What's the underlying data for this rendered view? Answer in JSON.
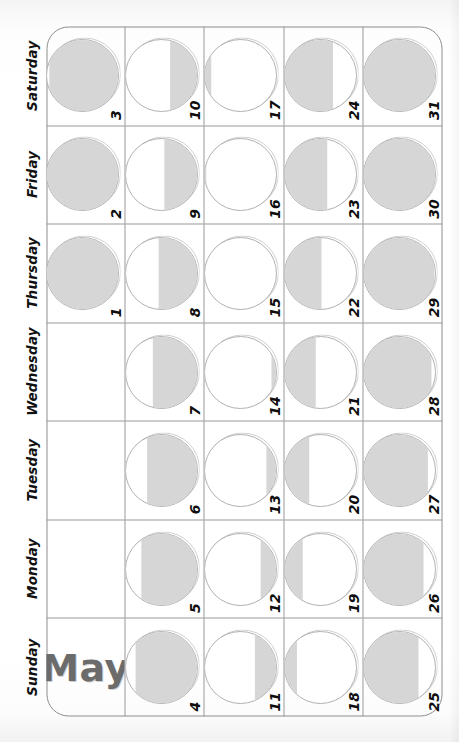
{
  "calendar": {
    "month_label": "May",
    "day_names": [
      "Sunday",
      "Monday",
      "Tuesday",
      "Wednesday",
      "Thursday",
      "Friday",
      "Saturday"
    ],
    "moon_fill_color": "#d6d6d6",
    "moon_outline_color": "#a8a8a8",
    "grid_line_color": "#9a9a9a",
    "text_color": "#111111",
    "month_text_color": "#6b6b6b",
    "weeks": [
      [
        {
          "kind": "month-title",
          "label": "May"
        },
        {
          "kind": "blank"
        },
        {
          "kind": "blank"
        },
        {
          "kind": "blank"
        },
        {
          "kind": "day",
          "number": "1",
          "illumination": 100,
          "phase": "full-moon",
          "shade": "top"
        },
        {
          "kind": "day",
          "number": "2",
          "illumination": 100,
          "phase": "full-moon",
          "shade": "top"
        },
        {
          "kind": "day",
          "number": "3",
          "illumination": 96,
          "phase": "waning-gibbous",
          "shade": "top"
        }
      ],
      [
        {
          "kind": "day",
          "number": "4",
          "illumination": 86,
          "phase": "waning-gibbous",
          "shade": "top"
        },
        {
          "kind": "day",
          "number": "5",
          "illumination": 78,
          "phase": "waning-gibbous",
          "shade": "top"
        },
        {
          "kind": "day",
          "number": "6",
          "illumination": 70,
          "phase": "waning-gibbous",
          "shade": "top"
        },
        {
          "kind": "day",
          "number": "7",
          "illumination": 62,
          "phase": "waning-gibbous",
          "shade": "top"
        },
        {
          "kind": "day",
          "number": "8",
          "illumination": 54,
          "phase": "last-quarter",
          "shade": "top"
        },
        {
          "kind": "day",
          "number": "9",
          "illumination": 46,
          "phase": "last-quarter",
          "shade": "top"
        },
        {
          "kind": "day",
          "number": "10",
          "illumination": 38,
          "phase": "waning-crescent",
          "shade": "top"
        }
      ],
      [
        {
          "kind": "day",
          "number": "11",
          "illumination": 30,
          "phase": "waning-crescent",
          "shade": "top"
        },
        {
          "kind": "day",
          "number": "12",
          "illumination": 22,
          "phase": "waning-crescent",
          "shade": "top"
        },
        {
          "kind": "day",
          "number": "13",
          "illumination": 14,
          "phase": "waning-crescent",
          "shade": "top"
        },
        {
          "kind": "day",
          "number": "14",
          "illumination": 7,
          "phase": "waning-crescent",
          "shade": "top"
        },
        {
          "kind": "day",
          "number": "15",
          "illumination": 1,
          "phase": "new-moon",
          "shade": "top"
        },
        {
          "kind": "day",
          "number": "16",
          "illumination": 1,
          "phase": "new-moon",
          "shade": "bottom"
        },
        {
          "kind": "day",
          "number": "17",
          "illumination": 8,
          "phase": "waxing-crescent",
          "shade": "bottom"
        }
      ],
      [
        {
          "kind": "day",
          "number": "18",
          "illumination": 16,
          "phase": "waxing-crescent",
          "shade": "bottom"
        },
        {
          "kind": "day",
          "number": "19",
          "illumination": 24,
          "phase": "waxing-crescent",
          "shade": "bottom"
        },
        {
          "kind": "day",
          "number": "20",
          "illumination": 33,
          "phase": "waxing-crescent",
          "shade": "bottom"
        },
        {
          "kind": "day",
          "number": "21",
          "illumination": 42,
          "phase": "first-quarter",
          "shade": "bottom"
        },
        {
          "kind": "day",
          "number": "22",
          "illumination": 50,
          "phase": "first-quarter",
          "shade": "bottom"
        },
        {
          "kind": "day",
          "number": "23",
          "illumination": 58,
          "phase": "waxing-gibbous",
          "shade": "bottom"
        },
        {
          "kind": "day",
          "number": "24",
          "illumination": 66,
          "phase": "waxing-gibbous",
          "shade": "bottom"
        }
      ],
      [
        {
          "kind": "day",
          "number": "25",
          "illumination": 75,
          "phase": "waxing-gibbous",
          "shade": "bottom"
        },
        {
          "kind": "day",
          "number": "26",
          "illumination": 82,
          "phase": "waxing-gibbous",
          "shade": "bottom"
        },
        {
          "kind": "day",
          "number": "27",
          "illumination": 88,
          "phase": "waxing-gibbous",
          "shade": "bottom"
        },
        {
          "kind": "day",
          "number": "28",
          "illumination": 93,
          "phase": "waxing-gibbous",
          "shade": "bottom"
        },
        {
          "kind": "day",
          "number": "29",
          "illumination": 97,
          "phase": "full-moon",
          "shade": "bottom"
        },
        {
          "kind": "day",
          "number": "30",
          "illumination": 100,
          "phase": "full-moon",
          "shade": "bottom"
        },
        {
          "kind": "day",
          "number": "31",
          "illumination": 100,
          "phase": "full-moon",
          "shade": "bottom"
        }
      ]
    ]
  }
}
